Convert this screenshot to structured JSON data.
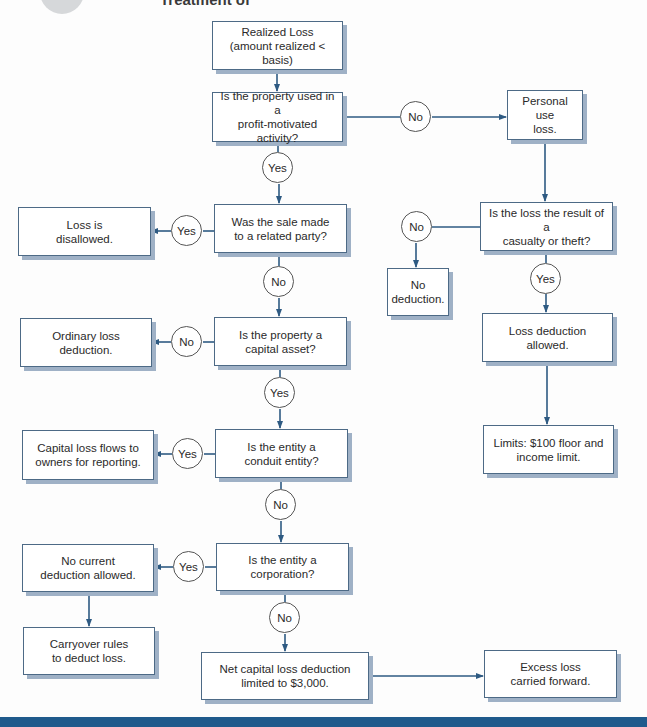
{
  "header": {
    "title": "Treatment of"
  },
  "colors": {
    "line": "#2e5a82",
    "box_border": "#4d6a86",
    "box_shadow": "#9fb1c6",
    "bottom_bar": "#1f5a8c"
  },
  "nodes": {
    "start": "Realized Loss\n(amount realized < basis)",
    "q_profit": "Is the property used in a\nprofit-motivated activity?",
    "personal_use": "Personal use\nloss.",
    "q_casualty": "Is the loss the result of a\ncasualty or theft?",
    "no_deduction": "No\ndeduction.",
    "loss_allowed": "Loss deduction\nallowed.",
    "limits": "Limits: $100 floor and\nincome limit.",
    "q_related": "Was the sale made\nto a related party?",
    "disallowed": "Loss is\ndisallowed.",
    "q_capital": "Is the property a\ncapital asset?",
    "ordinary": "Ordinary loss\ndeduction.",
    "q_conduit": "Is the entity a\nconduit entity?",
    "flows": "Capital loss flows to\nowners for reporting.",
    "q_corp": "Is the entity a\ncorporation?",
    "no_current": "No current\ndeduction allowed.",
    "carryover": "Carryover rules\nto deduct loss.",
    "net_capital": "Net capital loss deduction\nlimited to $3,000.",
    "excess": "Excess loss\ncarried forward."
  },
  "labels": {
    "profit_no": "No",
    "profit_yes": "Yes",
    "casualty_no": "No",
    "casualty_yes": "Yes",
    "related_yes": "Yes",
    "related_no": "No",
    "capital_no": "No",
    "capital_yes": "Yes",
    "conduit_yes": "Yes",
    "conduit_no": "No",
    "corp_yes": "Yes",
    "corp_no": "No"
  }
}
